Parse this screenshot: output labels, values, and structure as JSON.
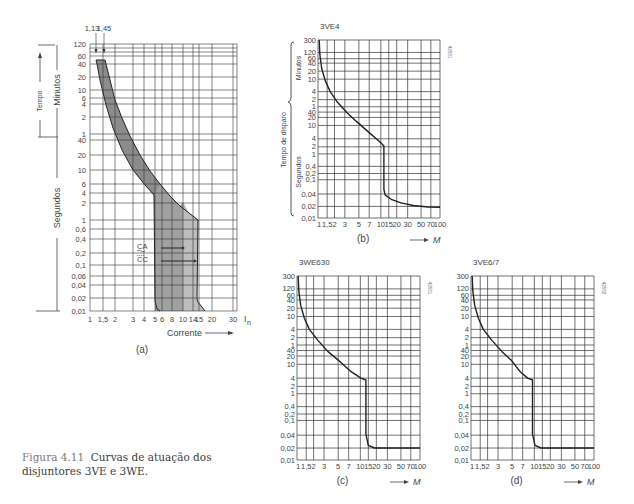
{
  "caption": {
    "figure_label": "Figura 4.11",
    "text": "Curvas de atuação dos disjuntores 3VE e 3WE."
  },
  "chart_data": [
    {
      "id": "a",
      "type": "area",
      "title": "",
      "subtitle": "(a)",
      "xlabel": "Corrente",
      "x_unit": "In",
      "ylabel": "Tempo",
      "y_groups": [
        "Minutos",
        "Segundos"
      ],
      "x_ticks": [
        "1",
        "1,5",
        "2",
        "3",
        "4",
        "5",
        "6",
        "8",
        "10",
        "14",
        "15",
        "20",
        "30"
      ],
      "x_tick_values": [
        1,
        1.5,
        2,
        3,
        4,
        5,
        6,
        8,
        10,
        14,
        15,
        20,
        30
      ],
      "y_ticks_minutes": [
        "120",
        "60",
        "40",
        "20",
        "10",
        "6",
        "4",
        "2",
        "1"
      ],
      "y_ticks_seconds": [
        "40",
        "20",
        "10",
        "6",
        "4",
        "2",
        "1",
        "0,6",
        "0,4",
        "0,2",
        "0,1",
        "0,06",
        "0,04",
        "0,02",
        "0,01"
      ],
      "top_markers": [
        "1,13",
        "1,45"
      ],
      "annotations": [
        "CA",
        "CC"
      ],
      "band": {
        "name": "Faixa de atuação",
        "lower_edge": [
          [
            1.13,
            60
          ],
          [
            1.2,
            40
          ],
          [
            1.5,
            10
          ],
          [
            2.3,
            2
          ],
          [
            3.2,
            40
          ],
          [
            4,
            15
          ],
          [
            5,
            6
          ],
          [
            5,
            0.012
          ],
          [
            5.5,
            0.01
          ]
        ],
        "upper_edge": [
          [
            1.45,
            60
          ],
          [
            1.6,
            30
          ],
          [
            2.3,
            4
          ],
          [
            3.5,
            1
          ],
          [
            6,
            20
          ],
          [
            8,
            5
          ],
          [
            10,
            2.5
          ],
          [
            15,
            1
          ],
          [
            15,
            0.02
          ],
          [
            20,
            0.01
          ]
        ]
      },
      "ca_range": [
        6,
        10
      ],
      "cc_range": [
        6,
        14
      ]
    },
    {
      "id": "b",
      "type": "line",
      "title": "3VE4",
      "subtitle": "(b)",
      "xlabel": "M",
      "ylabel": "Tempo de disparo",
      "y_groups": [
        "Minutos",
        "Segundos"
      ],
      "code": "42581",
      "x_ticks": [
        "1",
        "1,5",
        "2",
        "3",
        "5",
        "7",
        "10",
        "15",
        "20",
        "30",
        "50",
        "70",
        "100"
      ],
      "y_ticks": [
        "300",
        "120",
        "60",
        "40",
        "20",
        "10",
        "4",
        "2",
        "1",
        "40",
        "20",
        "10",
        "4",
        "2",
        "1",
        "0,4",
        "0,2",
        "0,1",
        "0,04",
        "0,02",
        "0,01"
      ],
      "series": [
        {
          "name": "3VE4",
          "points": [
            [
              1.05,
              "300m"
            ],
            [
              1.15,
              "30m"
            ],
            [
              1.4,
              "10m"
            ],
            [
              2,
              "4m"
            ],
            [
              3,
              "1m"
            ],
            [
              5,
              "20s"
            ],
            [
              7,
              "5s"
            ],
            [
              11,
              "2s"
            ],
            [
              11,
              "0.05s"
            ],
            [
              13,
              "0.035s"
            ],
            [
              20,
              "0.025s"
            ],
            [
              50,
              "0.02s"
            ],
            [
              90,
              "0.019s"
            ]
          ]
        }
      ]
    },
    {
      "id": "c",
      "type": "line",
      "title": "3WE630",
      "subtitle": "(c)",
      "xlabel": "M",
      "code": "42581",
      "x_ticks": [
        "1",
        "1,5",
        "2",
        "3",
        "5",
        "7",
        "10",
        "15",
        "20",
        "30",
        "50",
        "70",
        "100"
      ],
      "y_ticks": [
        "300",
        "120",
        "60",
        "40",
        "20",
        "10",
        "4",
        "2",
        "1",
        "40",
        "20",
        "10",
        "4",
        "2",
        "1",
        "0,4",
        "0,2",
        "0,1",
        "0,04",
        "0,02",
        "0,01"
      ],
      "series": [
        {
          "name": "3WE630",
          "points": [
            [
              1.05,
              "300m"
            ],
            [
              1.15,
              "40m"
            ],
            [
              1.4,
              "10m"
            ],
            [
              2,
              "3m"
            ],
            [
              3,
              "50s"
            ],
            [
              5,
              "15s"
            ],
            [
              7,
              "7s"
            ],
            [
              12,
              "4s"
            ],
            [
              12,
              "0.03s"
            ],
            [
              14,
              "0.015s"
            ],
            [
              100,
              "0.015s"
            ]
          ]
        }
      ]
    },
    {
      "id": "d",
      "type": "line",
      "title": "3VE6/7",
      "subtitle": "(d)",
      "xlabel": "M",
      "code": "42582",
      "x_ticks": [
        "1",
        "1,5",
        "2",
        "3",
        "5",
        "7",
        "10",
        "15",
        "20",
        "30",
        "50",
        "70",
        "100"
      ],
      "y_ticks": [
        "300",
        "120",
        "60",
        "40",
        "20",
        "10",
        "4",
        "2",
        "1",
        "40",
        "20",
        "10",
        "4",
        "2",
        "1",
        "0,4",
        "0,2",
        "0,1",
        "0,04",
        "0,02",
        "0,01"
      ],
      "series": [
        {
          "name": "3VE6/7",
          "points": [
            [
              1.05,
              "300m"
            ],
            [
              1.15,
              "40m"
            ],
            [
              1.4,
              "10m"
            ],
            [
              2,
              "3m"
            ],
            [
              3,
              "50s"
            ],
            [
              5,
              "12s"
            ],
            [
              7,
              "6s"
            ],
            [
              10,
              "4s"
            ],
            [
              10,
              "0.03s"
            ],
            [
              12,
              "0.015s"
            ],
            [
              100,
              "0.015s"
            ]
          ]
        }
      ]
    }
  ]
}
